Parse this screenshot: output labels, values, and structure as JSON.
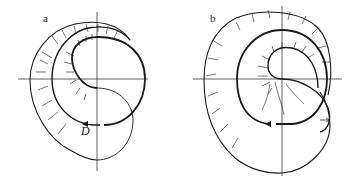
{
  "figure": {
    "panels": [
      {
        "id": "a",
        "label": "a",
        "marker_label": "D"
      },
      {
        "id": "b",
        "label": "b"
      }
    ],
    "colors": {
      "stroke": "#1a1a1a",
      "background": "#ffffff"
    }
  }
}
